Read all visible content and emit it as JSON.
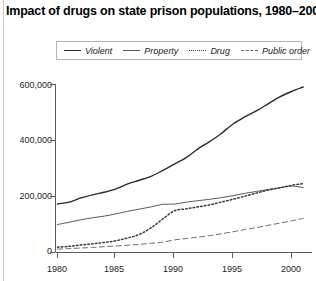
{
  "title": "Impact of drugs on state prison populations, 1980–2001",
  "legend": {
    "position": "top-center",
    "items": [
      {
        "label": "Violent",
        "style": "solid-thick",
        "swatch": "violent-line-swatch"
      },
      {
        "label": "Property",
        "style": "solid-thin",
        "swatch": "property-line-swatch"
      },
      {
        "label": "Drug",
        "style": "dotted",
        "swatch": "drug-line-swatch"
      },
      {
        "label": "Public order",
        "style": "dashed",
        "swatch": "public-order-line-swatch"
      }
    ]
  },
  "axes": {
    "y_ticks": [
      "0",
      "200,000",
      "400,000",
      "600,000"
    ],
    "x_ticks": [
      "1980",
      "1985",
      "1990",
      "1995",
      "2000"
    ]
  },
  "chart_data": {
    "type": "line",
    "title": "Impact of drugs on state prison populations, 1980–2001",
    "xlabel": "",
    "ylabel": "",
    "xlim": [
      1980,
      2001
    ],
    "ylim": [
      0,
      600000
    ],
    "ytick_values": [
      0,
      200000,
      400000,
      600000
    ],
    "ytick_labels": [
      "0",
      "200,000",
      "400,000",
      "600,000"
    ],
    "xtick_values": [
      1980,
      1985,
      1990,
      1995,
      2000
    ],
    "xtick_labels": [
      "1980",
      "1985",
      "1990",
      "1995",
      "2000"
    ],
    "grid": false,
    "legend_position": "top-center",
    "x": [
      1980,
      1981,
      1982,
      1983,
      1984,
      1985,
      1986,
      1987,
      1988,
      1989,
      1990,
      1991,
      1992,
      1993,
      1994,
      1995,
      1996,
      1997,
      1998,
      1999,
      2000,
      2001
    ],
    "series": [
      {
        "name": "Violent",
        "line_style": "solid",
        "line_width": 1.4,
        "color": "#2b2b2b",
        "values": [
          173300,
          180000,
          195000,
          206000,
          215000,
          227000,
          245000,
          258000,
          272000,
          293000,
          316000,
          339000,
          370000,
          396000,
          425000,
          459000,
          484000,
          506000,
          531000,
          556000,
          575000,
          591000
        ]
      },
      {
        "name": "Property",
        "line_style": "solid",
        "line_width": 1.0,
        "color": "#5a5a5a",
        "values": [
          100000,
          108000,
          117000,
          124000,
          130000,
          138000,
          147000,
          155000,
          163000,
          172000,
          173000,
          180000,
          185000,
          190000,
          196000,
          203000,
          211000,
          218000,
          225000,
          231000,
          237000,
          232000
        ]
      },
      {
        "name": "Drug",
        "line_style": "dotted",
        "line_width": 1.5,
        "color": "#3a3a3a",
        "values": [
          19000,
          22000,
          27000,
          31000,
          36000,
          42000,
          52000,
          65000,
          88000,
          120000,
          149000,
          156000,
          163000,
          170000,
          180000,
          190000,
          201000,
          212000,
          223000,
          231000,
          240000,
          246000
        ]
      },
      {
        "name": "Public order",
        "line_style": "dashed",
        "line_width": 1.0,
        "color": "#6a6a6a",
        "values": [
          12000,
          14000,
          16000,
          18000,
          21000,
          23000,
          26000,
          29000,
          33000,
          37000,
          45000,
          50000,
          55000,
          60000,
          67000,
          74000,
          82000,
          89000,
          97000,
          105000,
          113000,
          122000
        ]
      }
    ]
  }
}
